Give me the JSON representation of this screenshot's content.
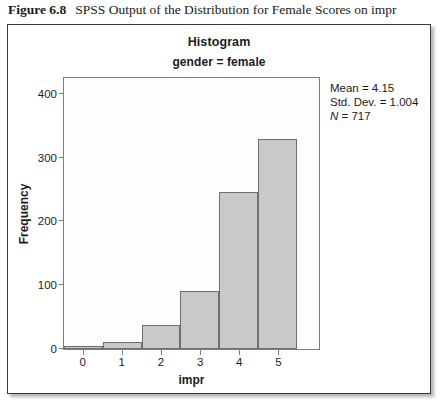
{
  "caption": {
    "label": "Figure 6.8",
    "text": "SPSS Output of the Distribution for Female Scores on impr"
  },
  "chart_data": {
    "type": "bar",
    "title": "Histogram",
    "subtitle": "gender = female",
    "xlabel": "impr",
    "ylabel": "Frequency",
    "categories": [
      "0",
      "1",
      "2",
      "3",
      "4",
      "5"
    ],
    "values": [
      4,
      11,
      37,
      91,
      246,
      330
    ],
    "ylim": [
      0,
      425
    ],
    "yticks": [
      "0",
      "100",
      "200",
      "300",
      "400"
    ],
    "ytick_values": [
      0,
      100,
      200,
      300,
      400
    ],
    "xticks": [
      "0",
      "1",
      "2",
      "3",
      "4",
      "5"
    ],
    "grid": false,
    "legend": "none",
    "bar_color": "#c9c9c9",
    "bar_border_color": "#6f6f6f",
    "annotations": {
      "mean": "Mean = 4.15",
      "std_dev": "Std. Dev. = 1.004",
      "n_symbol": "N",
      "n_value": " = 717"
    }
  }
}
